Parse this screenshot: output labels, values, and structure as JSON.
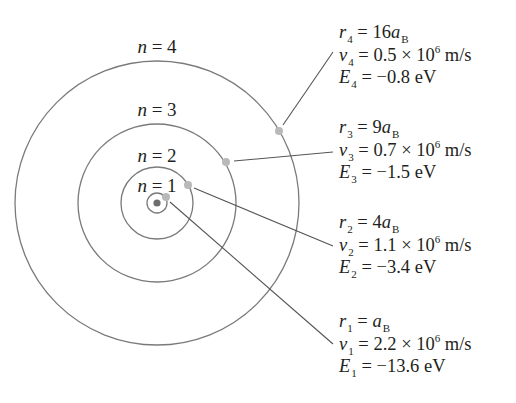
{
  "diagram": {
    "colors": {
      "orbit": "#7a7a7a",
      "leader": "#555555",
      "electron": "#b9b9b9",
      "nucleus": "#6d6d6d",
      "text": "#231f20"
    },
    "center": {
      "x": 157,
      "y": 203
    },
    "orbits": [
      {
        "n": 1,
        "label": "n = 1",
        "radius": 10
      },
      {
        "n": 2,
        "label": "n = 2",
        "radius": 36
      },
      {
        "n": 3,
        "label": "n = 3",
        "radius": 79
      },
      {
        "n": 4,
        "label": "n = 4",
        "radius": 142
      }
    ],
    "levels": [
      {
        "n": 4,
        "r": {
          "symbol": "r",
          "sub": "4",
          "eq": " = ",
          "value": "16",
          "unit_symbol": "a",
          "unit_sub": "B"
        },
        "v": {
          "symbol": "v",
          "sub": "4",
          "eq": " = ",
          "mantissa": "0.5 × 10",
          "exp": "6",
          "unit": " m/s"
        },
        "E": {
          "symbol": "E",
          "sub": "4",
          "eq": " = ",
          "value": "−0.8 eV"
        }
      },
      {
        "n": 3,
        "r": {
          "symbol": "r",
          "sub": "3",
          "eq": " = ",
          "value": "9",
          "unit_symbol": "a",
          "unit_sub": "B"
        },
        "v": {
          "symbol": "v",
          "sub": "3",
          "eq": " = ",
          "mantissa": "0.7 × 10",
          "exp": "6",
          "unit": " m/s"
        },
        "E": {
          "symbol": "E",
          "sub": "3",
          "eq": " = ",
          "value": "−1.5 eV"
        }
      },
      {
        "n": 2,
        "r": {
          "symbol": "r",
          "sub": "2",
          "eq": " = ",
          "value": "4",
          "unit_symbol": "a",
          "unit_sub": "B"
        },
        "v": {
          "symbol": "v",
          "sub": "2",
          "eq": " = ",
          "mantissa": "1.1 × 10",
          "exp": "6",
          "unit": " m/s"
        },
        "E": {
          "symbol": "E",
          "sub": "2",
          "eq": " = ",
          "value": "−3.4 eV"
        }
      },
      {
        "n": 1,
        "r": {
          "symbol": "r",
          "sub": "1",
          "eq": " = ",
          "value": "",
          "unit_symbol": "a",
          "unit_sub": "B"
        },
        "v": {
          "symbol": "v",
          "sub": "1",
          "eq": " = ",
          "mantissa": "2.2 × 10",
          "exp": "6",
          "unit": " m/s"
        },
        "E": {
          "symbol": "E",
          "sub": "1",
          "eq": " = ",
          "value": "−13.6 eV"
        }
      }
    ]
  }
}
